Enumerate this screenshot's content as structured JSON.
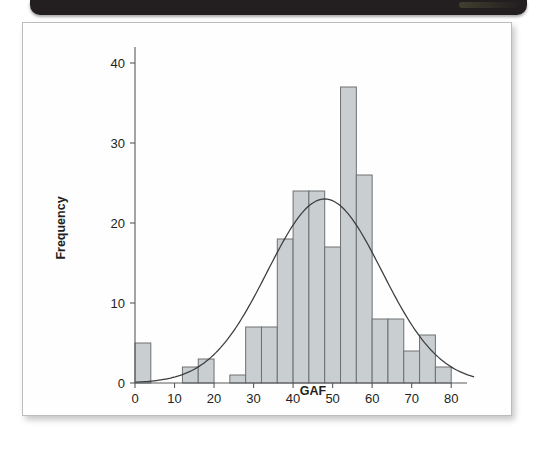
{
  "figure": {
    "type": "histogram-figure",
    "background_color": "#fefefe",
    "border_color": "#b9bdc0",
    "top_bar_color": "#231f20"
  },
  "chart_data": {
    "type": "bar",
    "title": "",
    "subtitle": "",
    "xlabel": "GAF",
    "ylabel": "Frequency",
    "xlim": [
      0,
      84
    ],
    "ylim": [
      0,
      42
    ],
    "xticks": [
      0,
      10,
      20,
      30,
      40,
      50,
      60,
      70,
      80
    ],
    "xtick_labels": [
      "0",
      "10",
      "20",
      "30",
      "40",
      "50",
      "60",
      "70",
      "80"
    ],
    "yticks": [
      0,
      10,
      20,
      30,
      40
    ],
    "ytick_labels": [
      "0",
      "10",
      "20",
      "30",
      "40"
    ],
    "grid": false,
    "legend": "none",
    "bin_width": 4,
    "bin_starts": [
      0,
      4,
      8,
      12,
      16,
      20,
      24,
      28,
      32,
      36,
      40,
      44,
      48,
      52,
      56,
      60,
      64,
      68,
      72,
      76
    ],
    "categories": [
      "0-4",
      "4-8",
      "8-12",
      "12-16",
      "16-20",
      "20-24",
      "24-28",
      "28-32",
      "32-36",
      "36-40",
      "40-44",
      "44-48",
      "48-52",
      "52-56",
      "56-60",
      "60-64",
      "64-68",
      "68-72",
      "72-76",
      "76-80"
    ],
    "values": [
      5,
      0,
      0,
      2,
      3,
      0,
      1,
      7,
      7,
      18,
      24,
      24,
      17,
      37,
      26,
      8,
      8,
      4,
      6,
      2
    ],
    "bar_fill_color": "#c9ced1",
    "bar_edge_color": "#6d7073",
    "overlay_curve": {
      "name": "normal-distribution-curve",
      "type": "line",
      "mean": 48,
      "std_dev": 14.5,
      "peak_value": 23,
      "stroke_color": "#3a3c3e"
    }
  },
  "labels": {
    "x_axis_title": "GAF",
    "y_axis_title": "Frequency"
  }
}
